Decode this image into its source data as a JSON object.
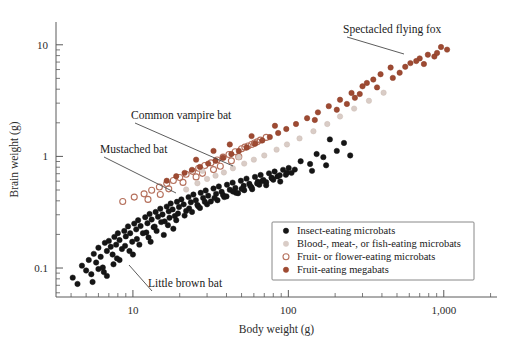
{
  "chart_data": {
    "type": "scatter",
    "title": "",
    "xlabel": "Body weight (g)",
    "ylabel": "Brain weight (g)",
    "xscale": "log",
    "yscale": "log",
    "xlim": [
      3.2,
      2200
    ],
    "ylim": [
      0.055,
      16
    ],
    "grid": false,
    "xticks": [
      10,
      100,
      1000
    ],
    "xticklabels": [
      "10",
      "100",
      "1,000"
    ],
    "yticks": [
      0.1,
      1,
      10
    ],
    "yticklabels": [
      "0.1",
      "1",
      "10"
    ],
    "legend_position": "lower-right",
    "series": [
      {
        "name": "Insect-eating microbats",
        "marker": "filled-circle",
        "color": "#151515",
        "edge": "#151515",
        "points": [
          [
            4.1,
            0.082
          ],
          [
            4.4,
            0.072
          ],
          [
            4.7,
            0.105
          ],
          [
            5.0,
            0.095
          ],
          [
            5.2,
            0.118
          ],
          [
            5.4,
            0.088
          ],
          [
            5.6,
            0.134
          ],
          [
            5.8,
            0.112
          ],
          [
            6.0,
            0.152
          ],
          [
            6.2,
            0.126
          ],
          [
            6.4,
            0.101
          ],
          [
            6.6,
            0.168
          ],
          [
            6.8,
            0.142
          ],
          [
            7.0,
            0.175
          ],
          [
            7.2,
            0.155
          ],
          [
            7.4,
            0.132
          ],
          [
            7.6,
            0.19
          ],
          [
            7.8,
            0.162
          ],
          [
            8.0,
            0.205
          ],
          [
            8.2,
            0.178
          ],
          [
            8.5,
            0.148
          ],
          [
            8.8,
            0.215
          ],
          [
            9.0,
            0.192
          ],
          [
            9.3,
            0.236
          ],
          [
            9.6,
            0.205
          ],
          [
            9.9,
            0.172
          ],
          [
            10.2,
            0.25
          ],
          [
            10.5,
            0.222
          ],
          [
            10.8,
            0.268
          ],
          [
            11.2,
            0.238
          ],
          [
            11.6,
            0.205
          ],
          [
            12.0,
            0.285
          ],
          [
            12.4,
            0.252
          ],
          [
            12.8,
            0.305
          ],
          [
            13.2,
            0.272
          ],
          [
            13.6,
            0.232
          ],
          [
            14.0,
            0.318
          ],
          [
            14.5,
            0.288
          ],
          [
            15.0,
            0.34
          ],
          [
            15.5,
            0.302
          ],
          [
            16.0,
            0.262
          ],
          [
            16.5,
            0.355
          ],
          [
            17.0,
            0.322
          ],
          [
            17.5,
            0.378
          ],
          [
            18.0,
            0.335
          ],
          [
            18.6,
            0.292
          ],
          [
            19.2,
            0.392
          ],
          [
            19.8,
            0.352
          ],
          [
            20.5,
            0.412
          ],
          [
            21.2,
            0.372
          ],
          [
            22.0,
            0.325
          ],
          [
            22.8,
            0.432
          ],
          [
            23.6,
            0.388
          ],
          [
            24.5,
            0.455
          ],
          [
            25.4,
            0.405
          ],
          [
            26.3,
            0.358
          ],
          [
            27.3,
            0.472
          ],
          [
            28.3,
            0.425
          ],
          [
            29.4,
            0.495
          ],
          [
            30.5,
            0.445
          ],
          [
            31.7,
            0.395
          ],
          [
            33.0,
            0.515
          ],
          [
            34.3,
            0.462
          ],
          [
            35.7,
            0.538
          ],
          [
            37.2,
            0.482
          ],
          [
            38.7,
            0.432
          ],
          [
            40.3,
            0.558
          ],
          [
            42.0,
            0.502
          ],
          [
            43.8,
            0.582
          ],
          [
            45.6,
            0.522
          ],
          [
            47.5,
            0.468
          ],
          [
            49.5,
            0.605
          ],
          [
            51.6,
            0.545
          ],
          [
            53.8,
            0.632
          ],
          [
            56.1,
            0.568
          ],
          [
            58.5,
            0.508
          ],
          [
            61.0,
            0.655
          ],
          [
            63.6,
            0.592
          ],
          [
            66.3,
            0.682
          ],
          [
            69.1,
            0.615
          ],
          [
            72.0,
            0.552
          ],
          [
            75.1,
            0.705
          ],
          [
            78.3,
            0.638
          ],
          [
            81.6,
            0.732
          ],
          [
            85.1,
            0.662
          ],
          [
            88.7,
            0.595
          ],
          [
            92.5,
            0.758
          ],
          [
            96.4,
            0.685
          ],
          [
            100.5,
            0.788
          ],
          [
            104.8,
            0.712
          ],
          [
            9.5,
            0.142
          ],
          [
            11.0,
            0.162
          ],
          [
            12.6,
            0.188
          ],
          [
            14.2,
            0.215
          ],
          [
            16.8,
            0.242
          ],
          [
            19.0,
            0.268
          ],
          [
            21.5,
            0.295
          ],
          [
            24.0,
            0.318
          ],
          [
            27.0,
            0.345
          ],
          [
            30.0,
            0.372
          ],
          [
            8.2,
            0.118
          ],
          [
            10.0,
            0.132
          ],
          [
            13.0,
            0.172
          ],
          [
            15.8,
            0.198
          ],
          [
            18.2,
            0.225
          ],
          [
            6.5,
            0.092
          ],
          [
            7.5,
            0.108
          ],
          [
            35.0,
            0.405
          ],
          [
            40.0,
            0.438
          ],
          [
            46.0,
            0.472
          ],
          [
            52.0,
            0.498
          ],
          [
            58.0,
            0.528
          ],
          [
            65.0,
            0.558
          ],
          [
            72.0,
            0.588
          ],
          [
            80.0,
            0.618
          ],
          [
            120,
            0.905
          ],
          [
            138,
            0.855
          ],
          [
            152,
            1.05
          ],
          [
            168,
            0.985
          ],
          [
            185,
            1.42
          ],
          [
            205,
            1.12
          ],
          [
            228,
            1.32
          ],
          [
            250,
            1.02
          ],
          [
            142,
            0.742
          ],
          [
            175,
            0.832
          ],
          [
            6.0,
            0.098
          ],
          [
            6.8,
            0.085
          ],
          [
            7.9,
            0.122
          ],
          [
            8.9,
            0.158
          ],
          [
            10.6,
            0.182
          ],
          [
            12.2,
            0.208
          ],
          [
            13.8,
            0.235
          ],
          [
            15.2,
            0.258
          ],
          [
            17.2,
            0.282
          ],
          [
            19.5,
            0.308
          ],
          [
            23.0,
            0.342
          ],
          [
            26.0,
            0.368
          ],
          [
            29.0,
            0.392
          ],
          [
            33.5,
            0.425
          ],
          [
            38.0,
            0.452
          ],
          [
            5.5,
            0.075
          ],
          [
            44.0,
            0.485
          ],
          [
            50.0,
            0.512
          ],
          [
            57.0,
            0.542
          ],
          [
            63.0,
            0.572
          ],
          [
            68.0,
            0.602
          ],
          [
            78.0,
            0.645
          ],
          [
            88.0,
            0.678
          ],
          [
            98.0,
            0.715
          ],
          [
            110,
            0.762
          ]
        ]
      },
      {
        "name": "Blood-, meat-, or fish-eating microbats",
        "marker": "filled-circle",
        "color": "#d9ccc6",
        "edge": "#cdbdb5",
        "points": [
          [
            22.0,
            0.505
          ],
          [
            26.0,
            0.575
          ],
          [
            30.0,
            0.628
          ],
          [
            34.0,
            0.672
          ],
          [
            38.5,
            0.718
          ],
          [
            44.0,
            0.782
          ],
          [
            52.0,
            0.862
          ],
          [
            60.0,
            0.935
          ],
          [
            70.0,
            1.02
          ],
          [
            84.0,
            1.15
          ],
          [
            98.0,
            1.28
          ],
          [
            118,
            1.45
          ],
          [
            145,
            1.68
          ],
          [
            178,
            1.95
          ],
          [
            215,
            2.28
          ],
          [
            265,
            2.68
          ],
          [
            330,
            3.15
          ],
          [
            410,
            3.72
          ],
          [
            28.0,
            0.742
          ],
          [
            48.0,
            0.985
          ]
        ]
      },
      {
        "name": "Fruit- or flower-eating microbats",
        "marker": "open-circle",
        "color": "none",
        "edge": "#b5705c",
        "points": [
          [
            8.6,
            0.395
          ],
          [
            10.2,
            0.432
          ],
          [
            11.8,
            0.462
          ],
          [
            13.2,
            0.498
          ],
          [
            14.8,
            0.532
          ],
          [
            16.5,
            0.572
          ],
          [
            18.2,
            0.608
          ],
          [
            20.0,
            0.648
          ],
          [
            22.0,
            0.692
          ],
          [
            24.2,
            0.735
          ],
          [
            26.5,
            0.782
          ],
          [
            29.0,
            0.828
          ],
          [
            31.8,
            0.875
          ],
          [
            34.8,
            0.928
          ],
          [
            38.0,
            0.985
          ],
          [
            41.5,
            1.04
          ],
          [
            45.5,
            1.1
          ],
          [
            50.0,
            1.17
          ],
          [
            55.0,
            1.24
          ],
          [
            60.5,
            1.32
          ],
          [
            17.0,
            0.512
          ],
          [
            21.0,
            0.585
          ],
          [
            25.5,
            0.655
          ],
          [
            33.0,
            0.762
          ],
          [
            43.0,
            0.912
          ],
          [
            12.5,
            0.412
          ],
          [
            15.0,
            0.455
          ],
          [
            28.0,
            0.705
          ],
          [
            36.5,
            0.815
          ],
          [
            48.0,
            0.995
          ],
          [
            66.0,
            1.4
          ],
          [
            72.0,
            1.48
          ],
          [
            58.0,
            1.28
          ],
          [
            52.5,
            1.21
          ],
          [
            63.0,
            1.35
          ]
        ]
      },
      {
        "name": "Fruit-eating megabats",
        "marker": "filled-circle",
        "color": "#9e4a32",
        "edge": "#8a3e28",
        "points": [
          [
            16.5,
            0.605
          ],
          [
            19.0,
            0.665
          ],
          [
            21.5,
            0.712
          ],
          [
            24.0,
            0.758
          ],
          [
            27.0,
            0.805
          ],
          [
            30.5,
            0.862
          ],
          [
            34.0,
            0.915
          ],
          [
            38.0,
            0.975
          ],
          [
            43.0,
            1.05
          ],
          [
            48.0,
            1.12
          ],
          [
            54.0,
            1.2
          ],
          [
            61.0,
            1.3
          ],
          [
            68.0,
            1.39
          ],
          [
            76.0,
            1.49
          ],
          [
            86.0,
            1.62
          ],
          [
            97.0,
            1.76
          ],
          [
            112,
            1.95
          ],
          [
            132,
            2.2
          ],
          [
            155,
            2.48
          ],
          [
            182,
            2.82
          ],
          [
            215,
            3.22
          ],
          [
            255,
            3.7
          ],
          [
            300,
            4.25
          ],
          [
            352,
            4.88
          ],
          [
            268,
            3.35
          ],
          [
            320,
            4.55
          ],
          [
            392,
            5.45
          ],
          [
            455,
            6.25
          ],
          [
            520,
            5.62
          ],
          [
            610,
            6.85
          ],
          [
            700,
            7.55
          ],
          [
            790,
            8.15
          ],
          [
            870,
            7.85
          ],
          [
            960,
            9.55
          ],
          [
            1050,
            9.05
          ],
          [
            25.5,
            0.935
          ],
          [
            33.0,
            1.12
          ],
          [
            42.0,
            1.28
          ],
          [
            58.0,
            1.52
          ],
          [
            82.0,
            1.88
          ],
          [
            148,
            2.12
          ],
          [
            205,
            2.62
          ],
          [
            238,
            2.95
          ],
          [
            288,
            3.62
          ],
          [
            372,
            4.15
          ],
          [
            470,
            5.05
          ],
          [
            565,
            6.35
          ],
          [
            665,
            7.15
          ],
          [
            745,
            6.72
          ],
          [
            905,
            8.45
          ]
        ]
      }
    ],
    "annotations": [
      {
        "label": "Spectacled flying fox",
        "lx": 343,
        "ly": 33,
        "ax": 404,
        "ay": 54,
        "anchor": "start"
      },
      {
        "label": "Common vampire bat",
        "lx": 131,
        "ly": 119,
        "ax": 233,
        "ay": 166,
        "anchor": "start"
      },
      {
        "label": "Mustached bat",
        "lx": 100,
        "ly": 153,
        "ax": 176,
        "ay": 193,
        "anchor": "start"
      },
      {
        "label": "Little brown bat",
        "lx": 148,
        "ly": 287,
        "ax": 129,
        "ay": 265,
        "anchor": "start"
      }
    ]
  },
  "legend": {
    "items": [
      {
        "label": "Insect-eating microbats",
        "marker": "filled-circle",
        "color": "#151515"
      },
      {
        "label": "Blood-, meat-, or fish-eating microbats",
        "marker": "filled-circle",
        "color": "#d9ccc6"
      },
      {
        "label": "Fruit- or flower-eating microbats",
        "marker": "open-circle",
        "color": "#b5705c"
      },
      {
        "label": "Fruit-eating megabats",
        "marker": "filled-circle",
        "color": "#9e4a32"
      }
    ]
  },
  "caption": {
    "text": "partial caption text cropped at page edge"
  }
}
